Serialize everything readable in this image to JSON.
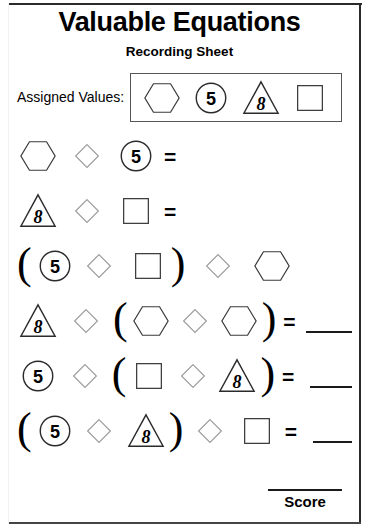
{
  "worksheet": {
    "title": "Valuable Equations",
    "subtitle": "Recording Sheet",
    "assigned_values_label": "Assigned Values:",
    "score_label": "Score",
    "equals_sign": "=",
    "paren_open": "(",
    "paren_close": ")",
    "answer_blank": ""
  },
  "shape_values": {
    "hexagon": "",
    "circle": "5",
    "triangle": "8",
    "square": "",
    "diamond": ""
  },
  "legend": {
    "items": [
      {
        "shape": "hexagon",
        "value": ""
      },
      {
        "shape": "circle",
        "value": "5"
      },
      {
        "shape": "triangle",
        "value": "8"
      },
      {
        "shape": "square",
        "value": ""
      }
    ]
  },
  "equations": [
    {
      "index": 1,
      "expression": "hexagon diamond circle(5) =",
      "has_equals": true,
      "has_blank": false
    },
    {
      "index": 2,
      "expression": "triangle(8) diamond square =",
      "has_equals": true,
      "has_blank": false
    },
    {
      "index": 3,
      "expression": "( circle(5) diamond square ) diamond hexagon",
      "has_equals": false,
      "has_blank": false
    },
    {
      "index": 4,
      "expression": "triangle(8) diamond ( hexagon diamond hexagon ) = ___",
      "has_equals": true,
      "has_blank": true
    },
    {
      "index": 5,
      "expression": "circle(5) diamond ( square diamond triangle(8) ) = ___",
      "has_equals": true,
      "has_blank": true
    },
    {
      "index": 6,
      "expression": "( circle(5) diamond triangle(8) ) diamond square = ___",
      "has_equals": true,
      "has_blank": true
    }
  ],
  "colors": {
    "ink": "#000000",
    "rule": "#2b2b2b",
    "shape_stroke": "#3a3a3a",
    "diamond_stroke": "#9a9a9a"
  }
}
